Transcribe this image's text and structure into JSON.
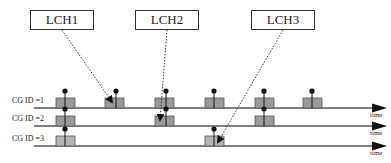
{
  "diagram": {
    "logical_channels": [
      {
        "label": "LCH1",
        "x": 30,
        "y": 10,
        "w": 64,
        "target": {
          "x": 112,
          "y": 102
        }
      },
      {
        "label": "LCH2",
        "x": 135,
        "y": 10,
        "w": 64,
        "target": {
          "x": 160,
          "y": 120
        }
      },
      {
        "label": "LCH3",
        "x": 251,
        "y": 10,
        "w": 64,
        "target": {
          "x": 218,
          "y": 142
        }
      }
    ],
    "rows": [
      {
        "label": "CG ID =1",
        "y": 108,
        "time_label": "time",
        "slots": [
          {
            "x": 56,
            "pin_offset": 9
          },
          {
            "x": 105,
            "pin_offset": 11
          },
          {
            "x": 155,
            "pin_offset": 11
          },
          {
            "x": 205,
            "pin_offset": 9
          },
          {
            "x": 255,
            "pin_offset": 9
          },
          {
            "x": 303,
            "pin_offset": 9
          }
        ]
      },
      {
        "label": "CG ID =2",
        "y": 126,
        "time_label": "time",
        "slots": [
          {
            "x": 56,
            "pin_offset": 9
          },
          {
            "x": 155,
            "pin_offset": 11
          },
          {
            "x": 255,
            "pin_offset": 9
          }
        ]
      },
      {
        "label": "CG ID =3",
        "y": 146,
        "time_label": "time",
        "slots": [
          {
            "x": 56,
            "pin_offset": 9
          },
          {
            "x": 205,
            "pin_offset": 9
          }
        ]
      }
    ],
    "colors": {
      "slot_fill": "#9a9a9a",
      "slot_fill_row3": "#b4b4b4",
      "line": "#555555",
      "arrow": "#111111"
    }
  }
}
